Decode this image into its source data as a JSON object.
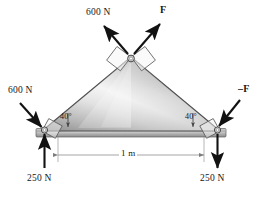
{
  "labels": {
    "apex_left_force": "600 N",
    "apex_right_force": "F",
    "left_joint_force": "600 N",
    "right_joint_force": "–F",
    "left_angle": "40°",
    "right_angle": "40°",
    "span_dimension": "1 m",
    "left_reaction": "250 N",
    "right_reaction": "250 N"
  },
  "geometry": {
    "apex": {
      "x": 131,
      "y": 57
    },
    "left_joint": {
      "x": 42,
      "y": 131
    },
    "right_joint": {
      "x": 220,
      "y": 131
    },
    "base_angle_deg": 40,
    "span_label": "1 m"
  },
  "colors": {
    "ink": "#161616",
    "truss_edge": "#4a4a4a",
    "truss_light": "#f2f2f2",
    "truss_mid": "#b9b9b9",
    "truss_dark": "#8a8a8a",
    "bar_light": "#e8e8e8",
    "bar_dark": "#9a9a9a",
    "dimension_line": "#8e8e8e",
    "joint_fill": "#ffffff",
    "background": "#ffffff"
  }
}
